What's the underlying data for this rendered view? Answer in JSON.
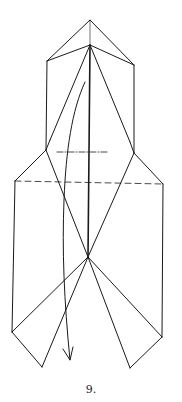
{
  "diagram": {
    "type": "origami-fold-step",
    "step_label": "9.",
    "stroke_color": "#1a1a1a",
    "elements": [
      {
        "kind": "edge",
        "name": "top-left-roof"
      },
      {
        "kind": "edge",
        "name": "top-right-roof"
      },
      {
        "kind": "valley-fold",
        "name": "center-fold-line"
      },
      {
        "kind": "mountain-fold",
        "name": "short-horizontal-fold"
      },
      {
        "kind": "valley-fold",
        "name": "long-horizontal-fold"
      },
      {
        "kind": "arrow",
        "name": "fold-down-arrow"
      }
    ]
  }
}
